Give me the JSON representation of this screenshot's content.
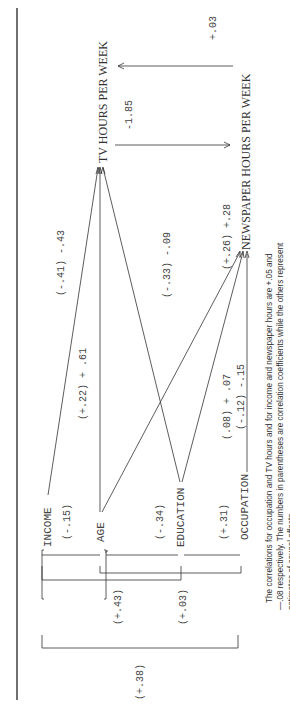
{
  "diagram": {
    "variables": {
      "income": "INCOME",
      "age": "AGE",
      "education": "EDUCATION",
      "occupation": "OCCUPATION",
      "tv": "TV HOURS PER WEEK",
      "newspaper": "NEWSPAPER HOURS PER WEEK"
    },
    "path_labels": {
      "income_tv": "(-.41) -.43",
      "age_tv": "(+.22) + .61",
      "education_tv": "(-.33) -.09",
      "age_newspaper": "(+.26) +.28",
      "education_newspaper": "(.08) + .07",
      "occupation_newspaper": "(-.12) -.15",
      "tv_to_newspaper": "-1.85",
      "newspaper_to_tv": "+.03"
    },
    "intercorrelations": {
      "income_age": "(-.15)",
      "age_education": "(-.34)",
      "education_occupation": "(+.31)",
      "income_education": "(+.43)",
      "age_occupation": "(+.03)",
      "income_occupation": "(+.38)"
    },
    "caption": {
      "line1": "The correlations for occupation and TV hours and for income and newspaper hours are +.05 and",
      "line2": "—.08 respectively. The numbers in parentheses are correlation coefficients while the others represent",
      "line3": "estimates of causal effects."
    }
  }
}
